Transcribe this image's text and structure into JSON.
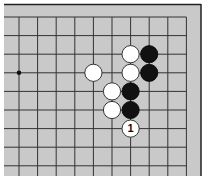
{
  "diagram": {
    "type": "go-board-fragment",
    "board_color": "#c9c9c9",
    "line_color": "#333333",
    "edges_shown": [
      "top",
      "right"
    ],
    "grid_x": [
      19,
      37.6,
      56.2,
      74.8,
      93.4,
      112,
      130.6,
      149.2,
      167.8,
      186.4
    ],
    "grid_y": [
      17,
      35.6,
      54.2,
      72.8,
      91.4,
      110,
      128.6,
      147.2,
      165.8
    ],
    "star_points": [
      {
        "col": 0,
        "row": 3
      }
    ],
    "stones": [
      {
        "color": "white",
        "col": 6,
        "row": 2
      },
      {
        "color": "black",
        "col": 7,
        "row": 2
      },
      {
        "color": "white",
        "col": 4,
        "row": 3
      },
      {
        "color": "white",
        "col": 6,
        "row": 3
      },
      {
        "color": "black",
        "col": 7,
        "row": 3
      },
      {
        "color": "white",
        "col": 5,
        "row": 4
      },
      {
        "color": "black",
        "col": 6,
        "row": 4
      },
      {
        "color": "white",
        "col": 5,
        "row": 5
      },
      {
        "color": "black",
        "col": 6,
        "row": 5
      },
      {
        "color": "white",
        "col": 6,
        "row": 6,
        "label": "1"
      }
    ]
  }
}
